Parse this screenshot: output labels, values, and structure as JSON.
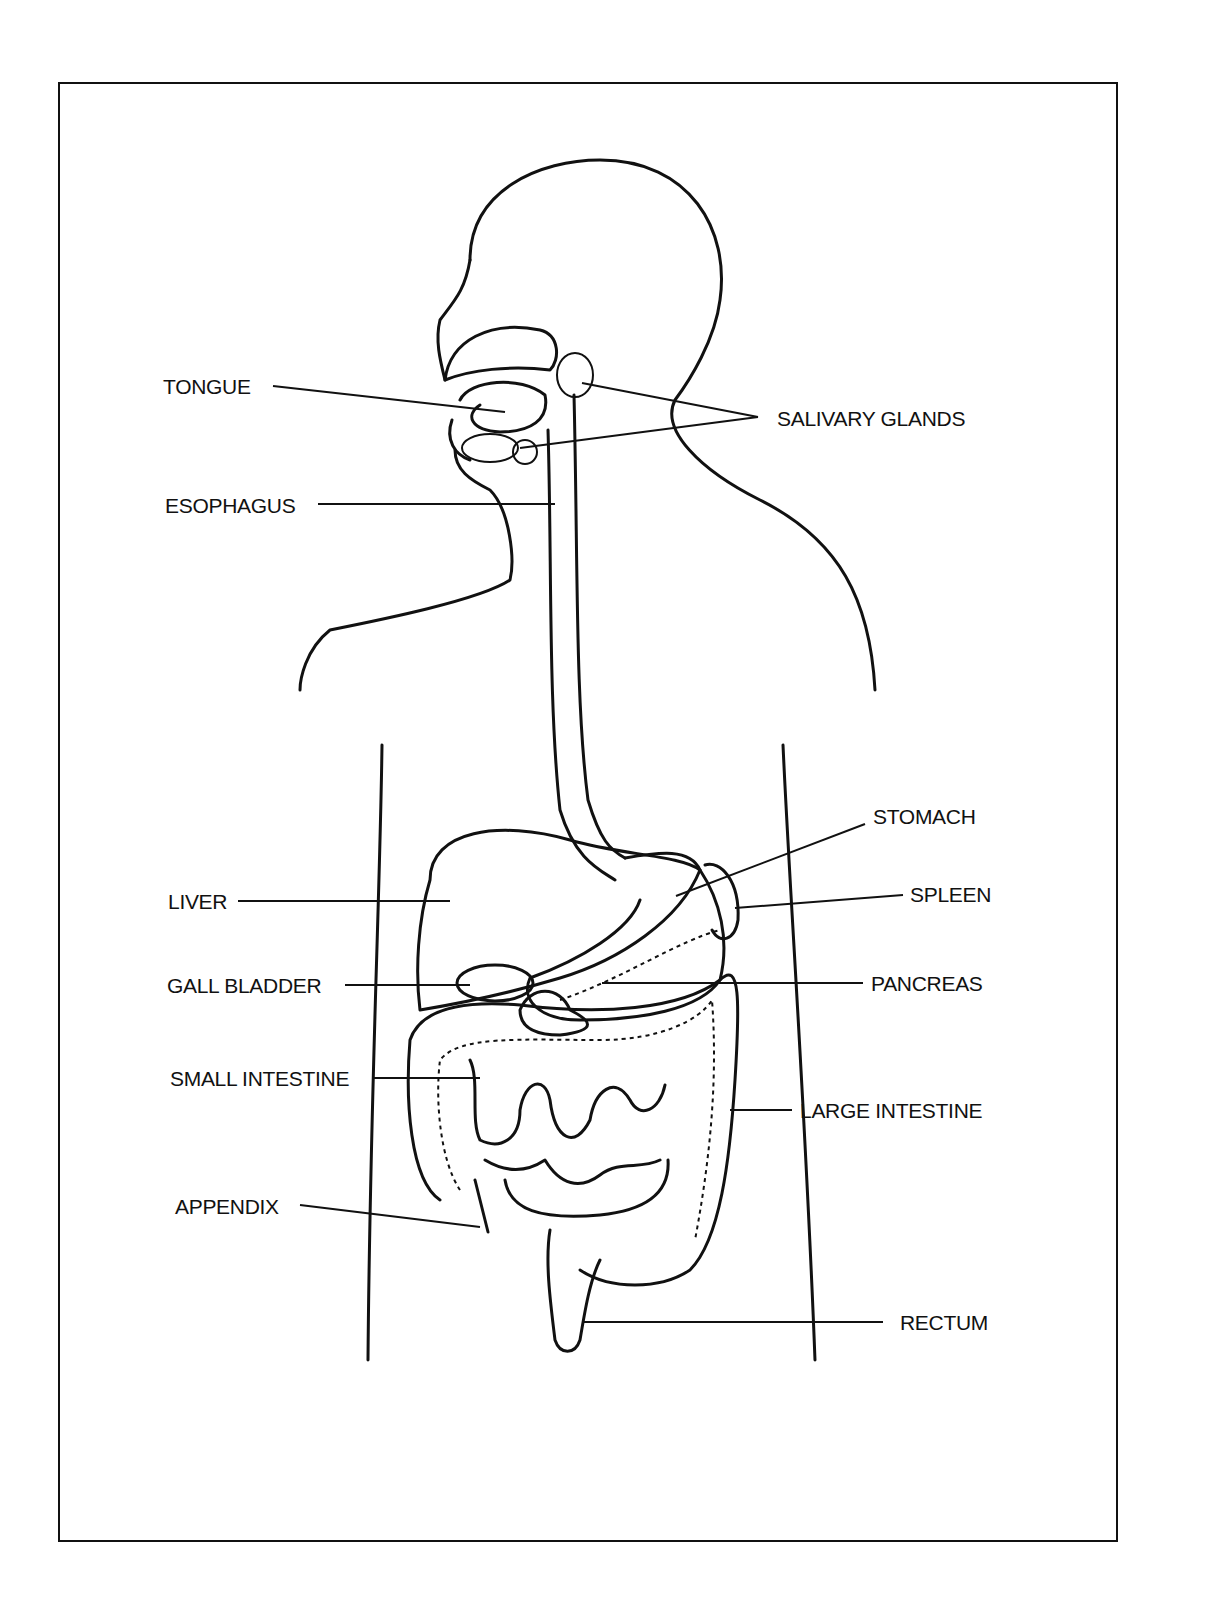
{
  "diagram": {
    "labels": {
      "tongue": "TONGUE",
      "esophagus": "ESOPHAGUS",
      "salivary_glands": "SALIVARY GLANDS",
      "stomach": "STOMACH",
      "liver": "LIVER",
      "spleen": "SPLEEN",
      "gall_bladder": "GALL BLADDER",
      "pancreas": "PANCREAS",
      "small_intestine": "SMALL INTESTINE",
      "large_intestine": "LARGE INTESTINE",
      "appendix": "APPENDIX",
      "rectum": "RECTUM"
    },
    "colors": {
      "line": "#111111",
      "background": "#ffffff"
    }
  }
}
